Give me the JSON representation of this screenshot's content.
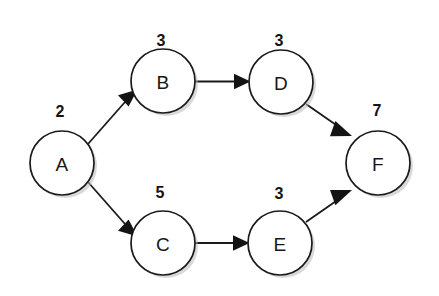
{
  "diagram": {
    "type": "directed-graph",
    "background_color": "#ffffff",
    "node_fill": "#ffffff",
    "node_stroke": "#1a1a1a",
    "text_color": "#161616",
    "nodes": [
      {
        "id": "A",
        "label": "A",
        "weight": "2",
        "cx": 62,
        "cy": 163,
        "r": 32,
        "weight_x": 60,
        "weight_y": 111
      },
      {
        "id": "B",
        "label": "B",
        "weight": "3",
        "cx": 163,
        "cy": 81,
        "r": 32,
        "weight_x": 161,
        "weight_y": 40
      },
      {
        "id": "C",
        "label": "C",
        "weight": "5",
        "cx": 163,
        "cy": 243,
        "r": 32,
        "weight_x": 160,
        "weight_y": 192
      },
      {
        "id": "D",
        "label": "D",
        "weight": "3",
        "cx": 281,
        "cy": 82,
        "r": 32,
        "weight_x": 279,
        "weight_y": 40
      },
      {
        "id": "E",
        "label": "E",
        "weight": "3",
        "cx": 280,
        "cy": 243,
        "r": 32,
        "weight_x": 279,
        "weight_y": 193
      },
      {
        "id": "F",
        "label": "F",
        "weight": "7",
        "cx": 378,
        "cy": 163,
        "r": 32,
        "weight_x": 377,
        "weight_y": 110
      }
    ],
    "edges": [
      {
        "id": "A-B",
        "from": "A",
        "to": "B",
        "direction": "up-right",
        "label": ""
      },
      {
        "id": "A-C",
        "from": "A",
        "to": "C",
        "direction": "down-right",
        "label": ""
      },
      {
        "id": "B-D",
        "from": "B",
        "to": "D",
        "direction": "right",
        "label": ""
      },
      {
        "id": "C-E",
        "from": "C",
        "to": "E",
        "direction": "right",
        "label": ""
      },
      {
        "id": "D-F",
        "from": "D",
        "to": "F",
        "direction": "down-right",
        "label": ""
      },
      {
        "id": "E-F",
        "from": "E",
        "to": "F",
        "direction": "up-right",
        "label": ""
      }
    ]
  }
}
